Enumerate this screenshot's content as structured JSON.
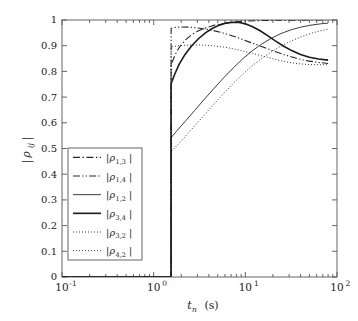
{
  "chart_data": {
    "type": "line",
    "title": "",
    "xlabel": "t_n (s)",
    "xlabel_parts": {
      "base": "t",
      "sub": "n",
      "unit": "(s)"
    },
    "ylabel": "|ρ_ij|",
    "ylabel_parts": {
      "bar": "|",
      "rho": "ρ",
      "sub": "ij"
    },
    "xscale": "log",
    "yscale": "linear",
    "xlim": [
      0.1,
      100
    ],
    "ylim": [
      0,
      1
    ],
    "grid": false,
    "legend_position": "lower-left",
    "x_tick_labels": [
      "10⁻¹",
      "10⁰",
      "10¹",
      "10²"
    ],
    "x_tick_values": [
      0.1,
      1,
      10,
      100
    ],
    "x_tick_parts": [
      {
        "base": "10",
        "exp": "-1"
      },
      {
        "base": "10",
        "exp": "0"
      },
      {
        "base": "10",
        "exp": "1"
      },
      {
        "base": "10",
        "exp": "2"
      }
    ],
    "y_tick_labels": [
      "0",
      "0.1",
      "0.2",
      "0.3",
      "0.4",
      "0.5",
      "0.6",
      "0.7",
      "0.8",
      "0.9",
      "1"
    ],
    "y_tick_values": [
      0,
      0.1,
      0.2,
      0.3,
      0.4,
      0.5,
      0.6,
      0.7,
      0.8,
      0.9,
      1.0
    ],
    "onset_x": 1.55,
    "series": [
      {
        "name": "|ρ_1,3|",
        "label_parts": {
          "rho": "ρ",
          "sub": "1,3"
        },
        "style": "dashdot",
        "width": 1.1,
        "color": "#262626",
        "points": [
          [
            1.55,
            0.0
          ],
          [
            1.55,
            0.825
          ],
          [
            1.7,
            0.862
          ],
          [
            1.9,
            0.893
          ],
          [
            2.2,
            0.921
          ],
          [
            2.6,
            0.943
          ],
          [
            3.0,
            0.956
          ],
          [
            3.6,
            0.968
          ],
          [
            4.4,
            0.978
          ],
          [
            5.4,
            0.985
          ],
          [
            6.8,
            0.99
          ],
          [
            8.5,
            0.994
          ],
          [
            11.0,
            0.996
          ],
          [
            15.0,
            0.998
          ],
          [
            22.0,
            0.999
          ],
          [
            35.0,
            0.999
          ],
          [
            55.0,
            1.0
          ],
          [
            80.0,
            1.0
          ]
        ]
      },
      {
        "name": "|ρ_1,4|",
        "label_parts": {
          "rho": "ρ",
          "sub": "1,4"
        },
        "style": "dashdotdot",
        "width": 1.1,
        "color": "#262626",
        "points": [
          [
            1.55,
            0.0
          ],
          [
            1.55,
            0.968
          ],
          [
            1.7,
            0.971
          ],
          [
            2.0,
            0.973
          ],
          [
            2.5,
            0.972
          ],
          [
            3.2,
            0.968
          ],
          [
            4.2,
            0.961
          ],
          [
            5.4,
            0.952
          ],
          [
            7.0,
            0.94
          ],
          [
            9.0,
            0.926
          ],
          [
            11.5,
            0.912
          ],
          [
            15.0,
            0.897
          ],
          [
            20.0,
            0.88
          ],
          [
            27.0,
            0.864
          ],
          [
            36.0,
            0.851
          ],
          [
            48.0,
            0.841
          ],
          [
            62.0,
            0.835
          ],
          [
            80.0,
            0.831
          ]
        ]
      },
      {
        "name": "|ρ_1,2|",
        "label_parts": {
          "rho": "ρ",
          "sub": "1,2"
        },
        "style": "solid",
        "width": 0.9,
        "color": "#262626",
        "points": [
          [
            1.55,
            0.0
          ],
          [
            1.55,
            0.542
          ],
          [
            1.8,
            0.57
          ],
          [
            2.2,
            0.605
          ],
          [
            2.8,
            0.648
          ],
          [
            3.5,
            0.688
          ],
          [
            4.5,
            0.732
          ],
          [
            5.8,
            0.775
          ],
          [
            7.5,
            0.816
          ],
          [
            9.5,
            0.851
          ],
          [
            12.0,
            0.881
          ],
          [
            15.0,
            0.906
          ],
          [
            19.0,
            0.928
          ],
          [
            24.0,
            0.946
          ],
          [
            31.0,
            0.961
          ],
          [
            40.0,
            0.972
          ],
          [
            52.0,
            0.98
          ],
          [
            66.0,
            0.985
          ],
          [
            80.0,
            0.988
          ]
        ]
      },
      {
        "name": "|ρ_3,4|",
        "label_parts": {
          "rho": "ρ",
          "sub": "3,4"
        },
        "style": "solid",
        "width": 1.6,
        "color": "#1a1a1a",
        "points": [
          [
            1.55,
            0.0
          ],
          [
            1.55,
            0.752
          ],
          [
            1.7,
            0.79
          ],
          [
            1.9,
            0.828
          ],
          [
            2.2,
            0.866
          ],
          [
            2.6,
            0.9
          ],
          [
            3.1,
            0.928
          ],
          [
            3.7,
            0.951
          ],
          [
            4.4,
            0.968
          ],
          [
            5.2,
            0.98
          ],
          [
            6.2,
            0.988
          ],
          [
            7.4,
            0.991
          ],
          [
            8.6,
            0.99
          ],
          [
            10.0,
            0.985
          ],
          [
            12.0,
            0.974
          ],
          [
            14.5,
            0.958
          ],
          [
            17.5,
            0.939
          ],
          [
            21.0,
            0.92
          ],
          [
            26.0,
            0.899
          ],
          [
            32.0,
            0.881
          ],
          [
            40.0,
            0.866
          ],
          [
            50.0,
            0.855
          ],
          [
            63.0,
            0.848
          ],
          [
            80.0,
            0.844
          ]
        ]
      },
      {
        "name": "|ρ_3,2|",
        "label_parts": {
          "rho": "ρ",
          "sub": "3,2"
        },
        "style": "dotted",
        "width": 1.0,
        "color": "#333333",
        "points": [
          [
            1.55,
            0.0
          ],
          [
            1.55,
            0.895
          ],
          [
            1.8,
            0.899
          ],
          [
            2.2,
            0.902
          ],
          [
            2.8,
            0.903
          ],
          [
            3.6,
            0.902
          ],
          [
            4.6,
            0.899
          ],
          [
            6.0,
            0.894
          ],
          [
            7.6,
            0.887
          ],
          [
            9.6,
            0.879
          ],
          [
            12.0,
            0.87
          ],
          [
            15.0,
            0.861
          ],
          [
            19.0,
            0.851
          ],
          [
            24.0,
            0.842
          ],
          [
            30.0,
            0.835
          ],
          [
            38.0,
            0.83
          ],
          [
            48.0,
            0.827
          ],
          [
            62.0,
            0.826
          ],
          [
            80.0,
            0.826
          ]
        ]
      },
      {
        "name": "|ρ_4,2|",
        "label_parts": {
          "rho": "ρ",
          "sub": "4,2"
        },
        "style": "dotted",
        "width": 1.0,
        "color": "#333333",
        "points": [
          [
            1.55,
            0.0
          ],
          [
            1.55,
            0.487
          ],
          [
            1.8,
            0.512
          ],
          [
            2.2,
            0.546
          ],
          [
            2.8,
            0.588
          ],
          [
            3.5,
            0.627
          ],
          [
            4.5,
            0.671
          ],
          [
            5.8,
            0.714
          ],
          [
            7.5,
            0.756
          ],
          [
            9.5,
            0.791
          ],
          [
            12.0,
            0.823
          ],
          [
            15.0,
            0.85
          ],
          [
            19.0,
            0.875
          ],
          [
            24.0,
            0.897
          ],
          [
            31.0,
            0.917
          ],
          [
            40.0,
            0.934
          ],
          [
            52.0,
            0.948
          ],
          [
            66.0,
            0.958
          ],
          [
            80.0,
            0.964
          ]
        ]
      }
    ],
    "legend_entries": [
      {
        "label": "|ρ_1,3|",
        "style": "dashdot"
      },
      {
        "label": "|ρ_1,4|",
        "style": "dashdotdot"
      },
      {
        "label": "|ρ_1,2|",
        "style": "solid"
      },
      {
        "label": "|ρ_3,4|",
        "style": "solid"
      },
      {
        "label": "|ρ_3,2|",
        "style": "dotted"
      },
      {
        "label": "|ρ_4,2|",
        "style": "dotted"
      }
    ]
  }
}
